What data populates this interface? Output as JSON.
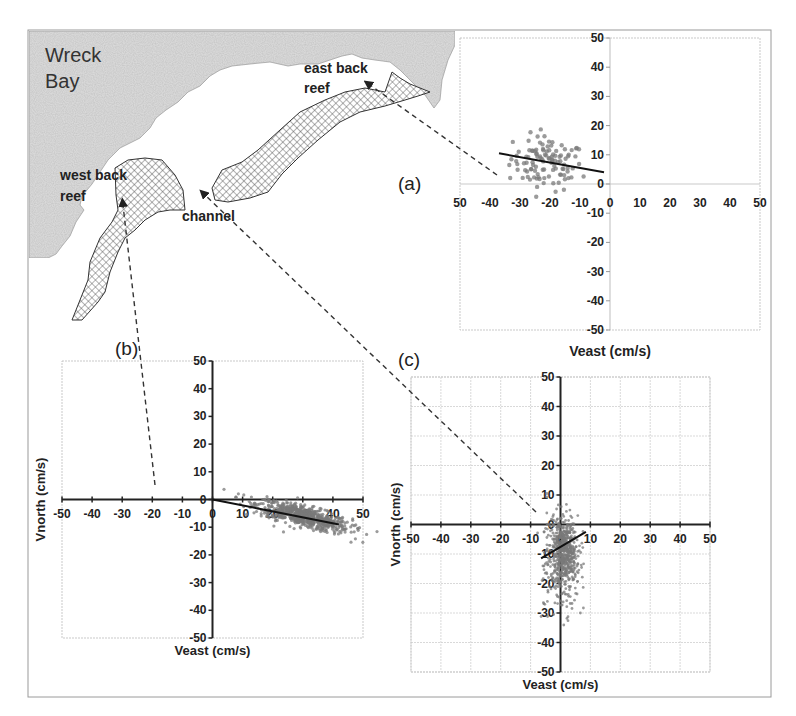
{
  "figure": {
    "frame": {
      "x": 28,
      "y": 30,
      "w": 743,
      "h": 667,
      "color": "#9a9a9a"
    },
    "colors": {
      "land": "#d6d6d6",
      "reef_stroke": "#333333",
      "hatch": "#555555",
      "scatter": "#7a7a7a",
      "axis": "#222222",
      "grid": "#c8c8c8",
      "dash": "#333333"
    }
  },
  "map": {
    "title": "Wreck Bay",
    "title_lines": [
      "Wreck",
      "Bay"
    ],
    "labels": {
      "east_back_reef": [
        "east back",
        "reef"
      ],
      "west_back_reef": [
        "west back",
        "reef"
      ],
      "channel": "channel"
    }
  },
  "panels": {
    "a": {
      "label": "(a)"
    },
    "b": {
      "label": "(b)"
    },
    "c": {
      "label": "(c)"
    }
  },
  "chart_data": [
    {
      "id": "a",
      "type": "scatter",
      "title": "(a) east back reef",
      "xlabel": "Veast (cm/s)",
      "ylabel": "",
      "xlim": [
        -50,
        50
      ],
      "ylim": [
        -50,
        50
      ],
      "xticks": [
        -50,
        -40,
        -30,
        -20,
        -10,
        0,
        10,
        20,
        30,
        40,
        50
      ],
      "xtick_labels": [
        "50",
        "-40",
        "-30",
        "-20",
        "-10",
        "0",
        "10",
        "20",
        "30",
        "40",
        "50"
      ],
      "yticks": [
        50,
        40,
        30,
        20,
        10,
        0,
        -10,
        -20,
        -30,
        -40,
        -50
      ],
      "grid": false,
      "box": {
        "x0": 460,
        "x1": 760,
        "y0": 38,
        "y1": 330
      },
      "cloud": {
        "cx": -21,
        "cy": 7,
        "sx": 6,
        "sy": 4.5,
        "n": 110,
        "rot": -0.15,
        "dot": 2.2
      },
      "fit_line": {
        "x": [
          -37,
          -2
        ],
        "y": [
          10.5,
          4
        ]
      }
    },
    {
      "id": "b",
      "type": "scatter",
      "title": "(b) west back reef",
      "xlabel": "Veast (cm/s)",
      "ylabel": "Vnorth (cm/s)",
      "xlim": [
        -50,
        50
      ],
      "ylim": [
        -50,
        50
      ],
      "xticks": [
        -50,
        -40,
        -30,
        -20,
        -10,
        0,
        10,
        20,
        30,
        40,
        50
      ],
      "xtick_labels": [
        "-50",
        "-40",
        "-30",
        "-20",
        "-10",
        "0",
        "10",
        "20",
        "30",
        "40",
        "50"
      ],
      "yticks": [
        50,
        40,
        30,
        20,
        10,
        0,
        -10,
        -20,
        -30,
        -40,
        -50
      ],
      "grid": false,
      "box": {
        "x0": 62,
        "x1": 363,
        "y0": 361,
        "y1": 638
      },
      "cloud": {
        "cx": 30,
        "cy": -6,
        "sx": 8,
        "sy": 1.8,
        "n": 700,
        "rot": -0.28,
        "dot": 1.6
      },
      "fit_line": {
        "x": [
          0,
          42
        ],
        "y": [
          0,
          -9
        ]
      }
    },
    {
      "id": "c",
      "type": "scatter",
      "title": "(c) channel",
      "xlabel": "Veast (cm/s)",
      "ylabel": "Vnorth (cm/s)",
      "xlim": [
        -50,
        50
      ],
      "ylim": [
        -50,
        50
      ],
      "xticks": [
        -50,
        -40,
        -30,
        -20,
        -10,
        0,
        10,
        20,
        30,
        40,
        50
      ],
      "xtick_labels": [
        "-50",
        "-40",
        "-30",
        "-20",
        "-10",
        "0",
        "10",
        "20",
        "30",
        "40",
        "50"
      ],
      "yticks": [
        50,
        40,
        30,
        20,
        10,
        0,
        -10,
        -20,
        -30,
        -40,
        -50
      ],
      "grid": true,
      "box": {
        "x0": 411,
        "x1": 710,
        "y0": 377,
        "y1": 672
      },
      "cloud": {
        "cx": 1,
        "cy": -9,
        "sx": 2.5,
        "sy": 6,
        "n": 650,
        "rot": 0.12,
        "dot": 1.4
      },
      "fit_line": {
        "x": [
          -6.5,
          8.5
        ],
        "y": [
          -11.5,
          -2.5
        ]
      }
    }
  ],
  "connectors": [
    {
      "from": [
        370,
        85
      ],
      "to": [
        497,
        175
      ],
      "arrow_at": [
        370,
        85
      ]
    },
    {
      "from": [
        123,
        205
      ],
      "to": [
        155,
        485
      ],
      "arrow_at": [
        123,
        205
      ]
    },
    {
      "from": [
        205,
        195
      ],
      "to": [
        536,
        512
      ],
      "arrow_at": [
        205,
        195
      ]
    }
  ]
}
